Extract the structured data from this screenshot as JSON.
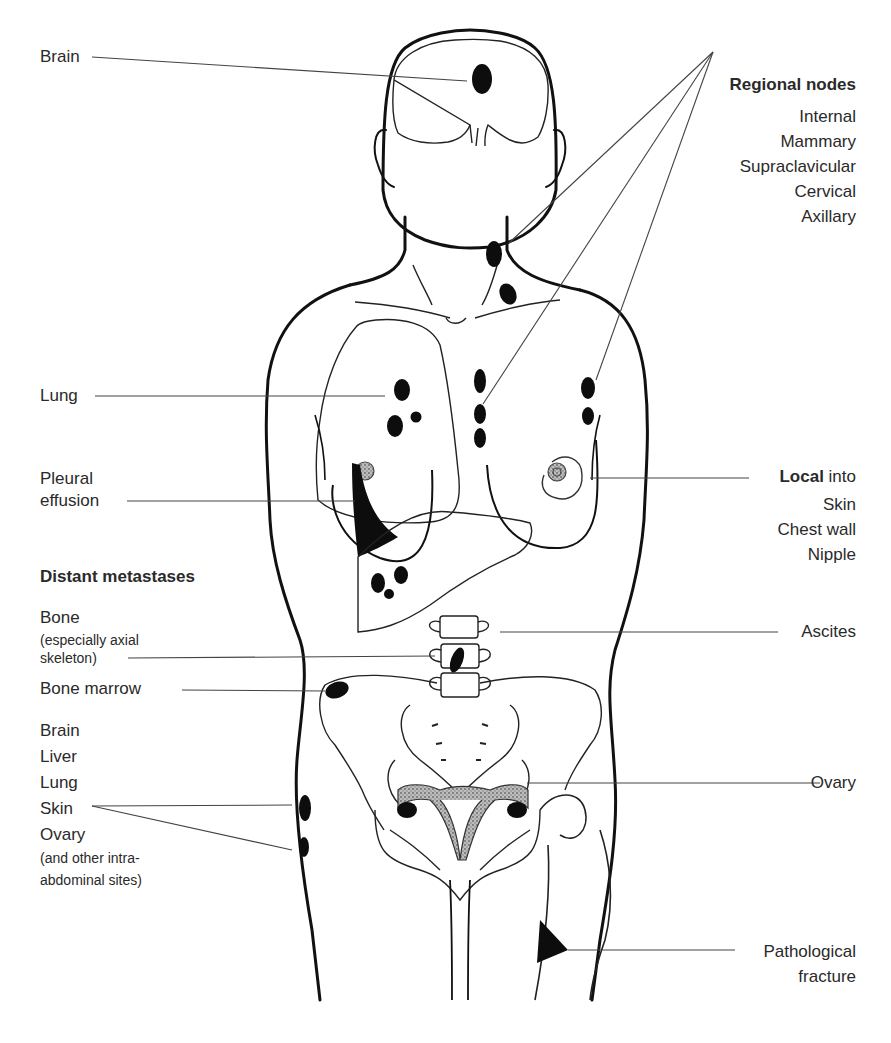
{
  "left_labels": {
    "brain": "Brain",
    "lung": "Lung",
    "pleural_effusion": [
      "Pleural",
      "effusion"
    ],
    "distant_heading": "Distant metastases",
    "bone": "Bone",
    "bone_note": [
      "(especially axial",
      "skeleton)"
    ],
    "bone_marrow": "Bone marrow",
    "distant_sites": [
      "Brain",
      "Liver",
      "Lung",
      "Skin",
      "Ovary"
    ],
    "distant_note": [
      "(and other intra-",
      "abdominal sites)"
    ]
  },
  "right_labels": {
    "regional_heading": "Regional nodes",
    "regional_items": [
      "Internal",
      "Mammary",
      "Supraclavicular",
      "Cervical",
      "Axillary"
    ],
    "local_bold": "Local",
    "local_suffix": " into",
    "local_items": [
      "Skin",
      "Chest wall",
      "Nipple"
    ],
    "ascites": "Ascites",
    "ovary": "Ovary",
    "fracture": [
      "Pathological",
      "fracture"
    ]
  },
  "colors": {
    "line": "#111111",
    "leader": "#444444",
    "lesion": "#0d0d0d",
    "stipple": "#8a8a8a"
  }
}
